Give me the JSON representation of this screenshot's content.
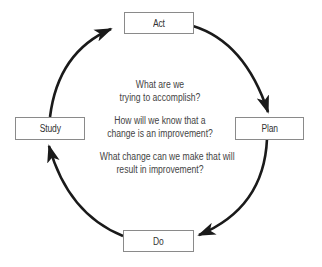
{
  "diagram": {
    "type": "cycle",
    "title": "",
    "nodes": [
      {
        "id": "act",
        "label": "Act"
      },
      {
        "id": "plan",
        "label": "Plan"
      },
      {
        "id": "do",
        "label": "Do"
      },
      {
        "id": "study",
        "label": "Study"
      }
    ],
    "edges": [
      {
        "from": "act",
        "to": "plan"
      },
      {
        "from": "plan",
        "to": "do"
      },
      {
        "from": "do",
        "to": "study"
      },
      {
        "from": "study",
        "to": "act"
      }
    ],
    "direction": "clockwise",
    "center_questions": [
      {
        "line1": "What are we",
        "line2": "trying to accomplish?"
      },
      {
        "line1": "How will we know that a",
        "line2": "change is an improvement?"
      },
      {
        "line1": "What change can we make that will",
        "line2": "result in improvement?"
      }
    ],
    "colors": {
      "arrow": "#1a1a1a",
      "box_border": "#8a8a8a",
      "box_text": "#333333",
      "center_text": "#444444",
      "background": "#ffffff"
    }
  }
}
